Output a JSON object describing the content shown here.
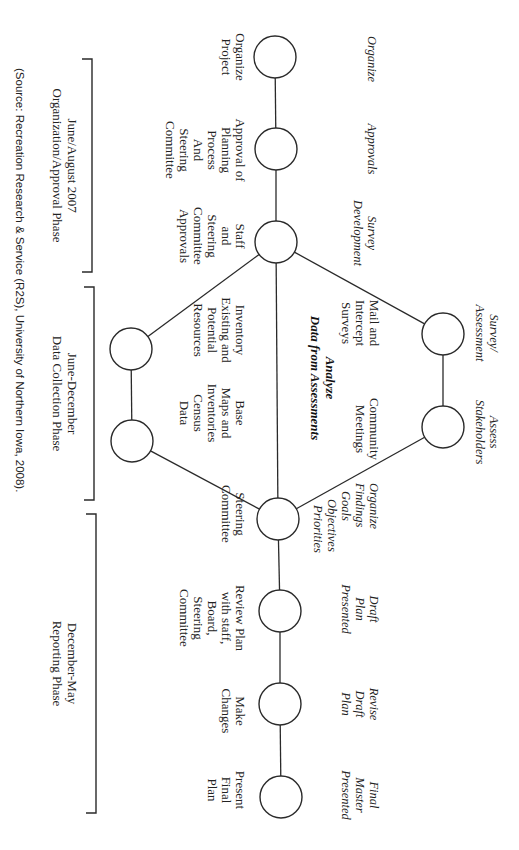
{
  "diagram": {
    "orientation": "rotated-90-clockwise",
    "colors": {
      "stroke": "#2a2a2a",
      "text": "#222222",
      "background": "#ffffff"
    },
    "nodes": [
      {
        "id": "n1",
        "cx": 275,
        "cy": 57,
        "r": 21,
        "task": [
          "Organize"
        ],
        "action": [
          "Organize",
          "Project"
        ]
      },
      {
        "id": "n2",
        "cx": 276,
        "cy": 149,
        "r": 21,
        "task": [
          "Approvals"
        ],
        "action": [
          "Approval of",
          "Planning",
          "Process",
          "And",
          "Steering",
          "Committee"
        ]
      },
      {
        "id": "n3",
        "cx": 276,
        "cy": 242,
        "r": 21,
        "task": [
          "Survey",
          "Development"
        ],
        "action": [
          "Staff",
          "and",
          "Steering",
          "Committee",
          "Approvals"
        ]
      },
      {
        "id": "u1",
        "cx": 443,
        "cy": 334,
        "r": 21,
        "task": [
          "Survey/",
          "Assessment"
        ],
        "action": [
          "Mail and",
          "Intercept",
          "Surveys"
        ]
      },
      {
        "id": "u2",
        "cx": 443,
        "cy": 427,
        "r": 21,
        "task": [
          "Assess",
          "Stakeholders"
        ],
        "action": [
          "Community",
          "Meetings"
        ]
      },
      {
        "id": "l1",
        "cx": 131,
        "cy": 349,
        "r": 21,
        "action": [
          "Inventory",
          "Existing and",
          "Potential",
          "Resources"
        ]
      },
      {
        "id": "l2",
        "cx": 132,
        "cy": 441,
        "r": 21,
        "action": [
          "Base",
          "Maps and",
          "Inventories",
          "Census",
          "Data"
        ]
      },
      {
        "id": "n4",
        "cx": 278,
        "cy": 519,
        "r": 21,
        "task": [
          "Organize",
          "Findings",
          "Goals",
          "Objectives",
          "Priorities"
        ],
        "action": [
          "Steering",
          "Committee"
        ]
      },
      {
        "id": "n5",
        "cx": 280,
        "cy": 611,
        "r": 21,
        "task": [
          "Draft",
          "Plan",
          "Presented"
        ],
        "action": [
          "Review Plan",
          "with staff,",
          "Board,",
          "Steering",
          "Committee"
        ]
      },
      {
        "id": "n6",
        "cx": 280,
        "cy": 704,
        "r": 21,
        "task": [
          "Revise",
          "Draft",
          "Plan"
        ],
        "action": [
          "Make",
          "Changes"
        ]
      },
      {
        "id": "n7",
        "cx": 281,
        "cy": 797,
        "r": 21,
        "task": [
          "Final",
          "Master",
          "Presented"
        ],
        "action": [
          "Present",
          "Final",
          "Plan"
        ]
      }
    ],
    "center_label": {
      "lines": [
        "Analyze",
        "Data from Assessments"
      ]
    },
    "edges": [
      {
        "from": "n1",
        "to": "n2"
      },
      {
        "from": "n2",
        "to": "n3"
      },
      {
        "from": "n3",
        "to": "n4"
      },
      {
        "from": "n3",
        "to": "u1"
      },
      {
        "from": "u1",
        "to": "u2"
      },
      {
        "from": "u2",
        "to": "n4"
      },
      {
        "from": "n3",
        "to": "l1"
      },
      {
        "from": "l1",
        "to": "l2"
      },
      {
        "from": "l2",
        "to": "n4"
      },
      {
        "from": "n4",
        "to": "n5"
      },
      {
        "from": "n5",
        "to": "n6"
      },
      {
        "from": "n6",
        "to": "n7"
      }
    ],
    "phases": [
      {
        "id": "phase-1",
        "lines": [
          "June/August 2007",
          "Organization/Approval Phase"
        ],
        "y_start": 59,
        "y_end": 272
      },
      {
        "id": "phase-2",
        "lines": [
          "June-December",
          "Data Collection Phase"
        ],
        "y_start": 287,
        "y_end": 500
      },
      {
        "id": "phase-3",
        "lines": [
          "December-May",
          "Reporting Phase"
        ],
        "y_start": 514,
        "y_end": 813
      }
    ],
    "source": "(Source: Recreation Research & Service (R2S), University of Northern Iowa, 2008)."
  }
}
